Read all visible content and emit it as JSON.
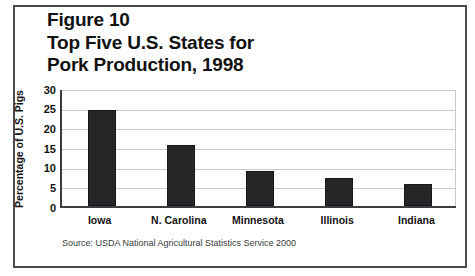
{
  "figure": {
    "title_lines": [
      "Figure 10",
      "Top Five U.S. States for",
      "Pork Production, 1998"
    ],
    "source_note": "Source: USDA National Agricultural Statistics Service 2000",
    "colors": {
      "bar": "#262628",
      "frame": "#4a4a50",
      "axis": "#3c3c42",
      "gridline": "#c9c9cf",
      "text": "#121212",
      "background": "#ffffff"
    }
  },
  "chart_data": {
    "type": "bar",
    "title": "Figure 10 Top Five U.S. States for Pork Production, 1998",
    "categories": [
      "Iowa",
      "N. Carolina",
      "Minnesota",
      "Illinois",
      "Indiana"
    ],
    "values": [
      24.4,
      15.4,
      8.8,
      7.2,
      5.7
    ],
    "xlabel": "",
    "ylabel": "Percentage of U.S. Pigs",
    "ylim": [
      0,
      30
    ],
    "yticks": [
      0,
      5,
      10,
      15,
      20,
      25,
      30
    ],
    "ytick_labels": [
      "0",
      "5",
      "10",
      "15",
      "20",
      "25",
      "30"
    ],
    "grid": true,
    "legend": false,
    "series": [
      {
        "name": "Percentage of U.S. Pigs",
        "values": [
          24.4,
          15.4,
          8.8,
          7.2,
          5.7
        ]
      }
    ]
  }
}
